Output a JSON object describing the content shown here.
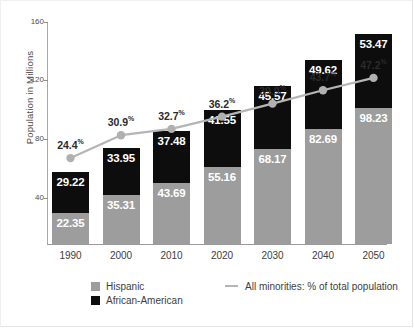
{
  "chart_data": {
    "type": "bar",
    "title": "",
    "subtitle": "",
    "xlabel": "",
    "ylabel": "Population in Millions",
    "categories": [
      "1990",
      "2000",
      "2010",
      "2020",
      "2030",
      "2040",
      "2050"
    ],
    "ylim": [
      0,
      160
    ],
    "yticks": [
      40,
      80,
      120,
      160
    ],
    "grid": false,
    "stacked": true,
    "legend_position": "bottom",
    "series": [
      {
        "name": "Hispanic",
        "color": "#9d9d9d",
        "values": [
          22.35,
          35.31,
          43.69,
          55.16,
          68.17,
          82.69,
          98.23
        ],
        "labels": [
          "22.35",
          "35.31",
          "43.69",
          "55.16",
          "68.17",
          "82.69",
          "98.23"
        ]
      },
      {
        "name": "African-American",
        "color": "#0d0d0d",
        "values": [
          29.22,
          33.95,
          37.48,
          41.55,
          45.57,
          49.62,
          53.47
        ],
        "labels": [
          "29.22",
          "33.95",
          "37.48",
          "41.55",
          "45.57",
          "49.62",
          "53.47"
        ]
      }
    ],
    "overlay_line": {
      "name": "All minorities:  % of total population",
      "color": "#b5b5b5",
      "unit": "%",
      "values": [
        24.4,
        30.9,
        32.7,
        36.2,
        39.9,
        43.7,
        47.2
      ],
      "labels": [
        "24.4",
        "30.9",
        "32.7",
        "36.2",
        "39.9",
        "43.7",
        "47.2"
      ]
    }
  },
  "axis": {
    "y_title": "Population in Millions",
    "y_ticks": [
      "160",
      "120",
      "80",
      "40"
    ],
    "x_ticks": [
      "1990",
      "2000",
      "2010",
      "2020",
      "2030",
      "2040",
      "2050"
    ]
  },
  "legend": {
    "hispanic_label": "Hispanic",
    "african_american_label": "African-American",
    "line_label": "All minorities:  % of total population"
  },
  "colors": {
    "hispanic": "#9d9d9d",
    "african_american": "#0d0d0d",
    "line": "#b5b5b5",
    "axis": "#9a9a9a",
    "text": "#3a3a3a",
    "background": "#ffffff"
  }
}
